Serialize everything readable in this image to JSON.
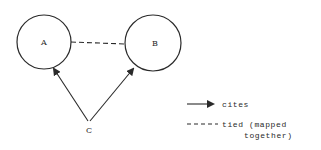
{
  "diagram": {
    "nodes": [
      {
        "id": "A",
        "label": "A",
        "shape": "circle"
      },
      {
        "id": "B",
        "label": "B",
        "shape": "circle"
      },
      {
        "id": "C",
        "label": "C",
        "shape": "point"
      }
    ],
    "edges": [
      {
        "from": "A",
        "to": "B",
        "type": "tied",
        "style": "dashed"
      },
      {
        "from": "C",
        "to": "A",
        "type": "cites",
        "style": "arrow"
      },
      {
        "from": "C",
        "to": "B",
        "type": "cites",
        "style": "arrow"
      }
    ],
    "legend": {
      "cites": {
        "label": "cites"
      },
      "tied": {
        "line1": "tied (mapped",
        "line2": "together)"
      }
    },
    "colors": {
      "stroke": "#2a2a2a",
      "background": "#ffffff"
    }
  }
}
